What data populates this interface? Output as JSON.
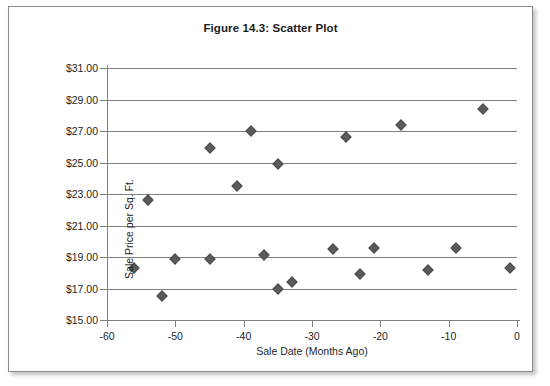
{
  "figure": {
    "title": "Figure 14.3: Scatter Plot"
  },
  "chart_data": {
    "type": "scatter",
    "title": "Figure 14.3: Scatter Plot",
    "xlabel": "Sale Date (Months Ago)",
    "ylabel": "Sale Price per Sq. Ft.",
    "xlim": [
      -60,
      0
    ],
    "ylim": [
      15,
      31
    ],
    "xticks": [
      -60,
      -50,
      -40,
      -30,
      -20,
      -10,
      0
    ],
    "xtick_labels": [
      "-60",
      "-50",
      "-40",
      "-30",
      "-20",
      "-10",
      "0"
    ],
    "yticks": [
      15,
      17,
      19,
      21,
      23,
      25,
      27,
      29,
      31
    ],
    "ytick_labels": [
      "$15.00",
      "$17.00",
      "$19.00",
      "$21.00",
      "$23.00",
      "$25.00",
      "$27.00",
      "$29.00",
      "$31.00"
    ],
    "grid": "horizontal",
    "legend": "none",
    "marker": "diamond",
    "marker_color": "#5c5c5c",
    "points": [
      {
        "x": -56,
        "y": 18.3
      },
      {
        "x": -54,
        "y": 22.6
      },
      {
        "x": -52,
        "y": 16.5
      },
      {
        "x": -50,
        "y": 18.9
      },
      {
        "x": -45,
        "y": 25.9
      },
      {
        "x": -45,
        "y": 18.9
      },
      {
        "x": -41,
        "y": 23.5
      },
      {
        "x": -39,
        "y": 27.0
      },
      {
        "x": -37,
        "y": 19.1
      },
      {
        "x": -35,
        "y": 24.9
      },
      {
        "x": -35,
        "y": 17.0
      },
      {
        "x": -33,
        "y": 17.4
      },
      {
        "x": -27,
        "y": 19.5
      },
      {
        "x": -25,
        "y": 26.6
      },
      {
        "x": -23,
        "y": 17.9
      },
      {
        "x": -21,
        "y": 19.6
      },
      {
        "x": -17,
        "y": 27.4
      },
      {
        "x": -13,
        "y": 18.2
      },
      {
        "x": -9,
        "y": 19.6
      },
      {
        "x": -5,
        "y": 28.4
      },
      {
        "x": -1,
        "y": 18.3
      }
    ]
  }
}
